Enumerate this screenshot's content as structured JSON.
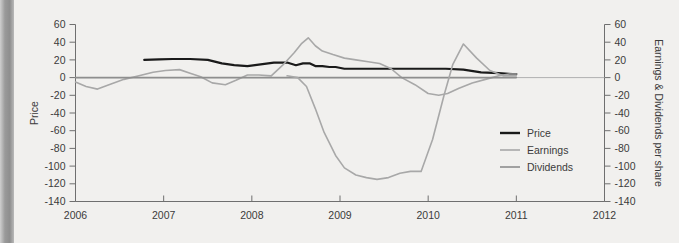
{
  "figure": {
    "background_color": "#f1f0ee",
    "left_band_color": "#969696",
    "axis_color": "#6f6f6f",
    "text_color": "#3b3b3b"
  },
  "chart_data": {
    "type": "line",
    "title": "",
    "xlabel": "",
    "ylabel": "Price",
    "y2label": "Earnings & Dividends per share",
    "xlim": [
      2006,
      2012
    ],
    "ylim": [
      -140,
      60
    ],
    "y2lim": [
      -140,
      60
    ],
    "grid": false,
    "legend_position": "center-right",
    "xticks": [
      2006,
      2007,
      2008,
      2009,
      2010,
      2011,
      2012
    ],
    "xticklabels": [
      "2006",
      "2007",
      "2008",
      "2009",
      "2010",
      "2011",
      "2012"
    ],
    "yticks": [
      60,
      40,
      20,
      0,
      -20,
      -40,
      -60,
      -80,
      -100,
      -120,
      -140
    ],
    "yticklabels": [
      "60",
      "40",
      "20",
      "0",
      "-20",
      "-40",
      "-60",
      "-80",
      "-100",
      "-120",
      "-140"
    ],
    "y2ticks": [
      60,
      40,
      20,
      0,
      -20,
      -40,
      -60,
      -80,
      -100,
      -120,
      -140
    ],
    "y2ticklabels": [
      "60",
      "40",
      "20",
      "0",
      "-20",
      "-40",
      "-60",
      "-80",
      "-100",
      "-120",
      "-140"
    ],
    "series": [
      {
        "name": "Price",
        "color": "#1a1a1a",
        "width": 2.2,
        "axis": "left",
        "x": [
          2006.78,
          2006.95,
          2007.1,
          2007.3,
          2007.5,
          2007.66,
          2007.8,
          2007.95,
          2008.1,
          2008.25,
          2008.4,
          2008.5,
          2008.58,
          2008.66,
          2008.72,
          2008.8,
          2008.88,
          2008.95,
          2009.05,
          2009.2,
          2009.4,
          2009.6,
          2009.8,
          2010.0,
          2010.2,
          2010.4,
          2010.6,
          2010.8,
          2010.95,
          2011.0
        ],
        "y": [
          20,
          20.5,
          21,
          21,
          20,
          16,
          14,
          13,
          15,
          17,
          17,
          14,
          16,
          16,
          13,
          13,
          12,
          12,
          10,
          10,
          10,
          10,
          10,
          10,
          10,
          9,
          6,
          5,
          4,
          4
        ]
      },
      {
        "name": "Earnings",
        "color": "#a8a8a8",
        "width": 1.6,
        "axis": "right",
        "x": [
          2006.0,
          2006.12,
          2006.25,
          2006.38,
          2006.55,
          2006.72,
          2006.88,
          2007.02,
          2007.18,
          2007.3,
          2007.42,
          2007.55,
          2007.7,
          2007.82,
          2007.95,
          2008.08,
          2008.22,
          2008.35,
          2008.48,
          2008.56,
          2008.64,
          2008.72,
          2008.8,
          2008.92,
          2009.05,
          2009.18,
          2009.32,
          2009.45,
          2009.58,
          2009.7,
          2009.85,
          2010.0,
          2010.12,
          2010.22,
          2010.35,
          2010.5,
          2010.65,
          2010.8,
          2010.92,
          2011.0
        ],
        "y": [
          -5,
          -10,
          -13,
          -8,
          -2,
          2,
          6,
          8,
          9,
          5,
          1,
          -6,
          -8,
          -3,
          3,
          3,
          2,
          14,
          28,
          38,
          45,
          36,
          30,
          26,
          22,
          20,
          18,
          16,
          10,
          0,
          -8,
          -18,
          -20,
          -18,
          -12,
          -6,
          -2,
          2,
          4,
          4
        ]
      },
      {
        "name": "Dividends",
        "color": "#8e8e8e",
        "width": 1.6,
        "axis": "right",
        "x": [
          2006.0,
          2006.3,
          2006.6,
          2006.9,
          2007.2,
          2007.5,
          2007.8,
          2008.1,
          2008.4,
          2008.7,
          2009.0,
          2009.3,
          2009.6,
          2009.9,
          2010.2,
          2010.5,
          2010.8,
          2011.0
        ],
        "y": [
          0,
          0,
          0,
          0,
          0,
          0,
          0,
          0,
          0,
          0,
          0,
          0,
          0,
          0,
          0,
          0,
          0,
          0
        ]
      },
      {
        "name": "EarningsDip",
        "color": "#a8a8a8",
        "width": 1.6,
        "axis": "right",
        "hidden_from_legend": true,
        "x": [
          2008.4,
          2008.52,
          2008.62,
          2008.72,
          2008.82,
          2008.95,
          2009.05,
          2009.18,
          2009.3,
          2009.42,
          2009.55,
          2009.68,
          2009.8,
          2009.92,
          2010.05,
          2010.18,
          2010.28,
          2010.4,
          2010.55,
          2010.7,
          2010.85,
          2011.0
        ],
        "y": [
          2,
          0,
          -10,
          -35,
          -62,
          -88,
          -102,
          -110,
          -113,
          -115,
          -113,
          -108,
          -106,
          -106,
          -70,
          -20,
          15,
          38,
          22,
          8,
          2,
          2
        ]
      }
    ],
    "legend": [
      {
        "label": "Price",
        "color": "#1a1a1a",
        "width": 2.4
      },
      {
        "label": "Earnings",
        "color": "#a8a8a8",
        "width": 1.6
      },
      {
        "label": "Dividends",
        "color": "#8e8e8e",
        "width": 1.6
      }
    ]
  }
}
